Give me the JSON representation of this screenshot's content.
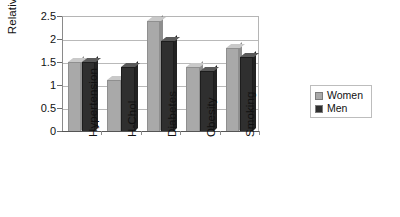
{
  "chart_data": {
    "type": "bar",
    "title": "",
    "xlabel": "",
    "ylabel": "Relative Risk",
    "categories": [
      "Hypertension",
      "H-Chol",
      "Diabetes",
      "Obesity",
      "Smoking"
    ],
    "series": [
      {
        "name": "Women",
        "color": "#a9a9a9",
        "values": [
          1.5,
          1.1,
          2.4,
          1.4,
          1.8
        ]
      },
      {
        "name": "Men",
        "color": "#2f2f2f",
        "values": [
          1.5,
          1.4,
          1.95,
          1.3,
          1.6
        ]
      }
    ],
    "ylim": [
      0,
      2.5
    ],
    "yticks": [
      0,
      0.5,
      1,
      1.5,
      2,
      2.5
    ],
    "ytick_labels": [
      "0",
      "0.5",
      "1",
      "1.5",
      "2",
      "2.5"
    ],
    "grid": true,
    "legend_position": "right",
    "legend_entries": [
      "Women",
      "Men"
    ]
  }
}
